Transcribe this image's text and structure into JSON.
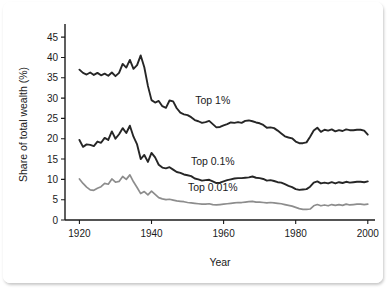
{
  "chart_data": {
    "type": "line",
    "title": "",
    "xlabel": "Year",
    "ylabel": "Share of total wealth (%)",
    "xlim": [
      1916,
      2002
    ],
    "ylim": [
      0,
      47
    ],
    "xticks": [
      1920,
      1940,
      1960,
      1980,
      2000
    ],
    "yticks": [
      0,
      5,
      10,
      15,
      20,
      25,
      30,
      35,
      40,
      45
    ],
    "grid": false,
    "legend_position": "inline-annotations",
    "annotations": [
      {
        "text": "Top 1%",
        "x": 1957,
        "y": 28.5
      },
      {
        "text": "Top 0.1%",
        "x": 1957,
        "y": 13.5
      },
      {
        "text": "Top 0.01%",
        "x": 1957,
        "y": 7.2
      }
    ],
    "colors": {
      "top1": "#262626",
      "top01": "#262626",
      "top001": "#8d8d8d",
      "axis": "#1a1a1a",
      "background": "#ffffff"
    },
    "x": [
      1920,
      1921,
      1922,
      1923,
      1924,
      1925,
      1926,
      1927,
      1928,
      1929,
      1930,
      1931,
      1932,
      1933,
      1934,
      1935,
      1936,
      1937,
      1938,
      1939,
      1940,
      1941,
      1942,
      1943,
      1944,
      1945,
      1946,
      1947,
      1948,
      1949,
      1950,
      1951,
      1952,
      1953,
      1954,
      1955,
      1956,
      1957,
      1958,
      1959,
      1960,
      1961,
      1962,
      1963,
      1964,
      1965,
      1966,
      1967,
      1968,
      1969,
      1970,
      1971,
      1972,
      1973,
      1974,
      1975,
      1976,
      1977,
      1978,
      1979,
      1980,
      1981,
      1982,
      1983,
      1984,
      1985,
      1986,
      1987,
      1988,
      1989,
      1990,
      1991,
      1992,
      1993,
      1994,
      1995,
      1996,
      1997,
      1998,
      1999,
      2000
    ],
    "series": [
      {
        "name": "Top 1%",
        "color": "#262626",
        "values": [
          37.0,
          36.2,
          35.8,
          36.3,
          35.7,
          36.2,
          35.6,
          36.0,
          35.5,
          36.3,
          35.4,
          36.2,
          38.4,
          37.5,
          39.4,
          37.2,
          38.1,
          40.5,
          37.6,
          33.0,
          29.5,
          28.9,
          29.3,
          28.0,
          27.6,
          29.4,
          29.2,
          27.5,
          26.4,
          26.0,
          25.8,
          25.3,
          24.6,
          24.3,
          23.9,
          24.1,
          24.4,
          23.6,
          22.8,
          22.9,
          23.3,
          23.6,
          24.0,
          23.9,
          24.1,
          23.9,
          24.4,
          24.5,
          24.3,
          24.0,
          23.8,
          23.4,
          22.7,
          22.8,
          22.6,
          22.0,
          21.3,
          20.6,
          20.3,
          20.1,
          19.3,
          18.9,
          18.9,
          19.1,
          20.5,
          22.0,
          22.7,
          21.7,
          22.2,
          22.0,
          22.3,
          21.8,
          22.1,
          21.9,
          22.3,
          22.1,
          22.1,
          22.2,
          22.2,
          22.0,
          21.0
        ]
      },
      {
        "name": "Top 0.1%",
        "color": "#262626",
        "values": [
          19.7,
          18.0,
          18.6,
          18.5,
          18.2,
          19.3,
          19.0,
          20.2,
          19.7,
          21.8,
          20.0,
          21.1,
          22.6,
          21.4,
          23.2,
          20.5,
          18.6,
          15.0,
          16.0,
          14.3,
          16.5,
          15.4,
          13.6,
          12.9,
          12.7,
          13.0,
          12.4,
          11.8,
          11.6,
          11.2,
          11.0,
          10.8,
          10.2,
          10.0,
          9.7,
          9.8,
          9.9,
          9.5,
          9.1,
          9.2,
          9.5,
          9.8,
          10.0,
          10.2,
          10.3,
          10.3,
          10.4,
          10.5,
          10.7,
          10.4,
          10.3,
          10.1,
          9.7,
          9.8,
          9.6,
          9.3,
          9.2,
          8.8,
          8.4,
          8.1,
          7.6,
          7.4,
          7.5,
          7.6,
          8.2,
          9.2,
          9.5,
          9.0,
          9.2,
          9.0,
          9.3,
          9.0,
          9.3,
          9.1,
          9.4,
          9.2,
          9.3,
          9.4,
          9.4,
          9.3,
          9.5
        ]
      },
      {
        "name": "Top 0.01%",
        "color": "#8d8d8d",
        "values": [
          10.1,
          9.0,
          8.1,
          7.4,
          7.3,
          7.8,
          8.2,
          9.0,
          8.8,
          10.1,
          9.3,
          9.5,
          10.7,
          10.0,
          11.1,
          9.4,
          8.0,
          6.5,
          7.0,
          6.2,
          7.1,
          6.3,
          5.5,
          5.2,
          5.0,
          5.1,
          4.9,
          4.7,
          4.6,
          4.5,
          4.3,
          4.2,
          4.1,
          4.0,
          3.9,
          3.9,
          4.0,
          3.8,
          3.7,
          3.8,
          3.9,
          4.0,
          4.1,
          4.2,
          4.3,
          4.3,
          4.4,
          4.5,
          4.6,
          4.4,
          4.4,
          4.3,
          4.2,
          4.3,
          4.2,
          4.1,
          4.0,
          3.8,
          3.6,
          3.4,
          3.1,
          2.8,
          2.6,
          2.6,
          2.7,
          3.5,
          3.8,
          3.5,
          3.7,
          3.5,
          3.8,
          3.6,
          3.8,
          3.6,
          3.9,
          3.7,
          3.8,
          3.9,
          3.9,
          3.8,
          3.9
        ]
      }
    ]
  }
}
